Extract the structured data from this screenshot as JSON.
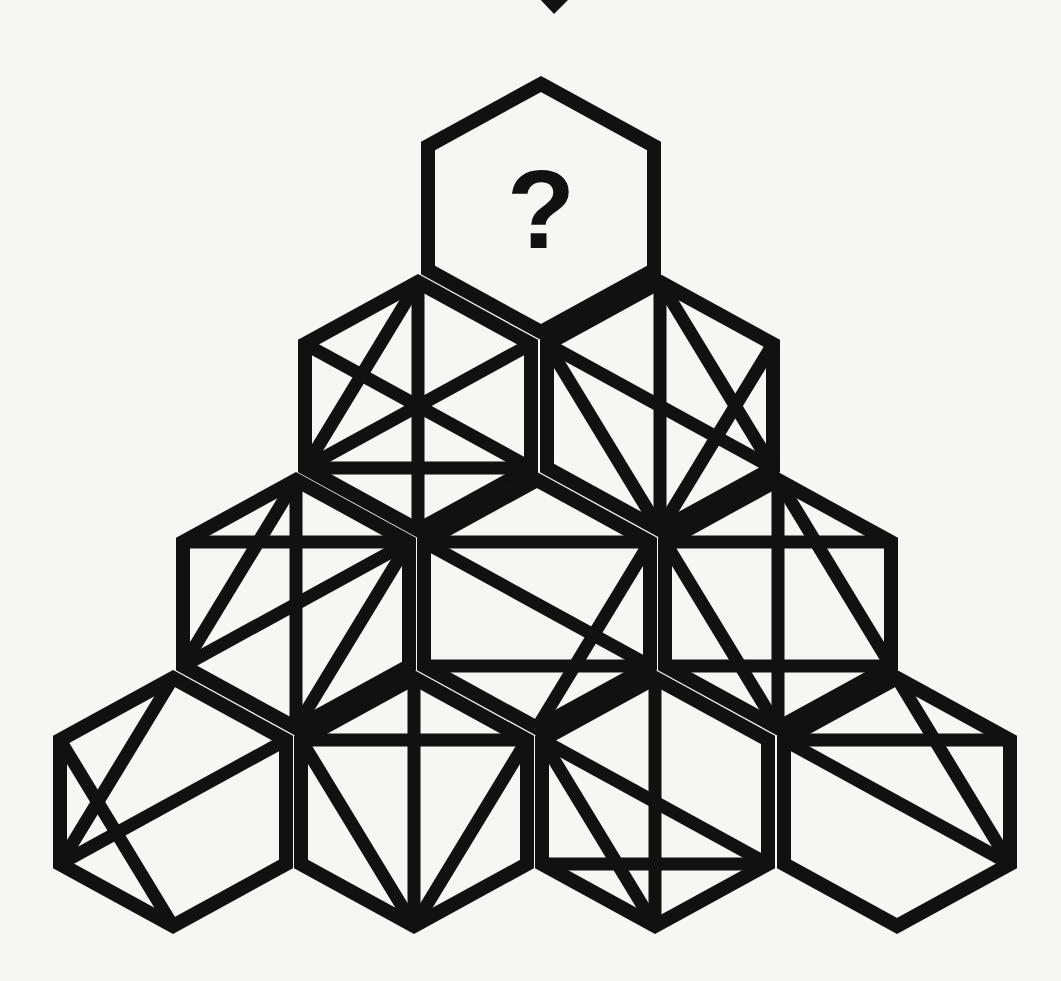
{
  "puzzle": {
    "type": "hexagon-pyramid",
    "question_mark": "?",
    "colors": {
      "background": "#f6f6f4",
      "stroke": "#111111"
    },
    "arrow": {
      "shape": "down-pointing-diamond",
      "tip": [
        554,
        14
      ]
    },
    "hex_geometry": {
      "half_width": 113,
      "half_height": 124,
      "vertex_order": [
        "top",
        "ur",
        "lr",
        "bottom",
        "ll",
        "ul"
      ]
    },
    "rows": [
      {
        "row": 1,
        "hexagons": [
          {
            "id": "r1c1",
            "center": [
              541,
              208
            ],
            "lines": [],
            "unknown": true
          }
        ]
      },
      {
        "row": 2,
        "hexagons": [
          {
            "id": "r2c1",
            "center": [
              418,
              406
            ],
            "lines": [
              [
                "top",
                "bottom"
              ],
              [
                "ul",
                "lr"
              ],
              [
                "ur",
                "ll"
              ],
              [
                "top",
                "ll"
              ],
              [
                "ll",
                "lr"
              ]
            ]
          },
          {
            "id": "r2c2",
            "center": [
              660,
              406
            ],
            "lines": [
              [
                "top",
                "bottom"
              ],
              [
                "ul",
                "lr"
              ],
              [
                "ul",
                "bottom"
              ],
              [
                "top",
                "lr"
              ],
              [
                "ur",
                "bottom"
              ]
            ]
          }
        ]
      },
      {
        "row": 3,
        "hexagons": [
          {
            "id": "r3c1",
            "center": [
              296,
              604
            ],
            "lines": [
              [
                "top",
                "bottom"
              ],
              [
                "ul",
                "ur"
              ],
              [
                "top",
                "ll"
              ],
              [
                "ur",
                "ll"
              ],
              [
                "ur",
                "bottom"
              ]
            ]
          },
          {
            "id": "r3c2",
            "center": [
              537,
              604
            ],
            "lines": [
              [
                "ul",
                "ur"
              ],
              [
                "ll",
                "lr"
              ],
              [
                "ul",
                "lr"
              ],
              [
                "ur",
                "bottom"
              ]
            ]
          },
          {
            "id": "r3c3",
            "center": [
              778,
              604
            ],
            "lines": [
              [
                "top",
                "bottom"
              ],
              [
                "ul",
                "ur"
              ],
              [
                "ll",
                "lr"
              ],
              [
                "ul",
                "bottom"
              ],
              [
                "top",
                "lr"
              ]
            ]
          }
        ]
      },
      {
        "row": 4,
        "hexagons": [
          {
            "id": "r4c1",
            "center": [
              173,
              802
            ],
            "lines": [
              [
                "top",
                "ll"
              ],
              [
                "ur",
                "ll"
              ],
              [
                "ul",
                "bottom"
              ]
            ]
          },
          {
            "id": "r4c2",
            "center": [
              414,
              802
            ],
            "lines": [
              [
                "top",
                "bottom"
              ],
              [
                "ul",
                "ur"
              ],
              [
                "ul",
                "bottom"
              ],
              [
                "ur",
                "bottom"
              ]
            ]
          },
          {
            "id": "r4c3",
            "center": [
              655,
              802
            ],
            "lines": [
              [
                "top",
                "bottom"
              ],
              [
                "ul",
                "lr"
              ],
              [
                "ul",
                "bottom"
              ],
              [
                "ll",
                "lr"
              ]
            ]
          },
          {
            "id": "r4c4",
            "center": [
              897,
              802
            ],
            "lines": [
              [
                "ul",
                "ur"
              ],
              [
                "ul",
                "lr"
              ],
              [
                "top",
                "lr"
              ]
            ]
          }
        ]
      }
    ]
  }
}
